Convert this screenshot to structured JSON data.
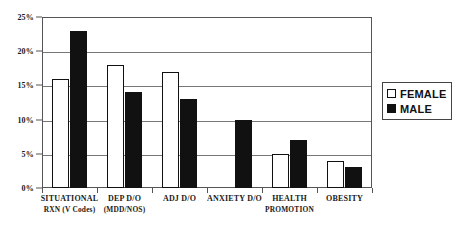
{
  "chart_data": {
    "type": "bar",
    "title": "",
    "subtitle": "",
    "xlabel": "",
    "ylabel": "",
    "ylim": [
      0,
      25
    ],
    "grid": true,
    "legend_position": "right",
    "categories": [
      "SITUATIONAL RXN (V Codes)",
      "DEP D/O (MDD/NOS)",
      "ADJ D/O",
      "ANXIETY D/O",
      "HEALTH PROMOTION",
      "OBESITY"
    ],
    "category_lines": [
      {
        "line1": "SITUATIONAL",
        "line2": "RXN (V Codes)"
      },
      {
        "line1": "DEP D/O",
        "line2": "(MDD/NOS)"
      },
      {
        "line1": "ADJ D/O",
        "line2": ""
      },
      {
        "line1": "ANXIETY D/O",
        "line2": ""
      },
      {
        "line1": "HEALTH",
        "line2": "PROMOTION"
      },
      {
        "line1": "OBESITY",
        "line2": ""
      }
    ],
    "series": [
      {
        "name": "FEMALE",
        "color": "#ffffff",
        "values": [
          16,
          18,
          17,
          0,
          5,
          4
        ]
      },
      {
        "name": "MALE",
        "color": "#111111",
        "values": [
          23,
          14,
          13,
          10,
          7,
          3
        ]
      }
    ],
    "y_ticks": [
      0,
      5,
      10,
      15,
      20,
      25
    ],
    "y_tick_labels": [
      "0%",
      "5%",
      "10%",
      "15%",
      "20%",
      "25%"
    ]
  },
  "legend": {
    "items": [
      {
        "label": "FEMALE",
        "marker": "hollow-square"
      },
      {
        "label": "MALE",
        "marker": "filled-square"
      }
    ]
  }
}
